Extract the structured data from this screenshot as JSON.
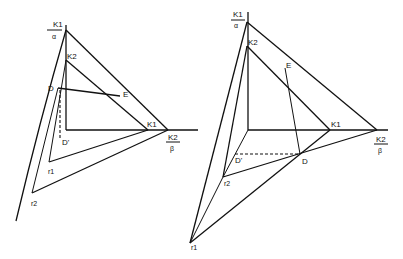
{
  "left_diagram": {
    "labels": {
      "top_num": "K1",
      "top_den": "α",
      "k2_vertical": "K2",
      "d": "D",
      "e": "E",
      "k1_horizontal": "K1",
      "right_num": "K2",
      "right_den": "β",
      "d_prime": "D'",
      "r1": "r1",
      "r2": "r2"
    }
  },
  "right_diagram": {
    "labels": {
      "top_num": "K1",
      "top_den": "α",
      "k2_vertical": "K2",
      "e": "E",
      "k1_horizontal": "K1",
      "right_num": "K2",
      "right_den": "β",
      "d": "D",
      "d_prime": "D'",
      "r2": "r2",
      "r1": "r1"
    }
  }
}
